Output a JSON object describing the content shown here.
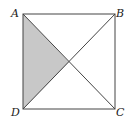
{
  "diagram": {
    "type": "geometry-square-with-diagonals",
    "vertices": [
      {
        "label": "A",
        "x": 23,
        "y": 14
      },
      {
        "label": "B",
        "x": 115,
        "y": 14
      },
      {
        "label": "C",
        "x": 115,
        "y": 109
      },
      {
        "label": "D",
        "x": 23,
        "y": 109
      }
    ],
    "diagonals": [
      "AC",
      "BD"
    ],
    "shaded_region": {
      "triangle": [
        "A",
        "O",
        "D"
      ],
      "color": "#c8c8c8"
    },
    "stroke_color": "#444444"
  }
}
